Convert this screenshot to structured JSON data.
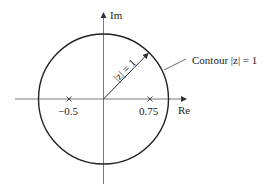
{
  "diagram": {
    "axes": {
      "x_label": "Re",
      "y_label": "Im"
    },
    "contour": {
      "label": "Contour |z| = 1",
      "radius": 1
    },
    "radius_label": "|z| = 1",
    "poles": [
      {
        "value": -0.5,
        "label": "−0.5"
      },
      {
        "value": 0.75,
        "label": "0.75"
      }
    ],
    "colors": {
      "stroke": "#222222",
      "axis": "#555555"
    }
  }
}
